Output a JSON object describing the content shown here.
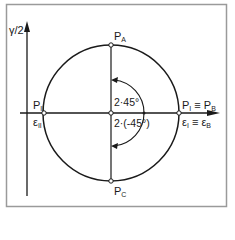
{
  "diagram": {
    "type": "mohr-circle-strain",
    "axis_y_label": "γ/2",
    "points": {
      "top": {
        "base": "P",
        "sub": "A"
      },
      "bottom": {
        "base": "P",
        "sub": "C"
      },
      "left_point": {
        "base": "P",
        "sub": "II"
      },
      "left_strain": {
        "base": "ε",
        "sub": "II"
      },
      "right_point": {
        "base": "P",
        "sub": "I",
        "eq": "≡",
        "base2": "P",
        "sub2": "B"
      },
      "right_strain": {
        "base": "ε",
        "sub": "I",
        "eq": "≡",
        "base2": "ε",
        "sub2": "B"
      }
    },
    "angles": {
      "upper": "2·45°",
      "lower": "2·(-45°)"
    },
    "colors": {
      "line": "#1a1a1a",
      "frame": "#9a9a9a",
      "background": "#ffffff"
    }
  }
}
